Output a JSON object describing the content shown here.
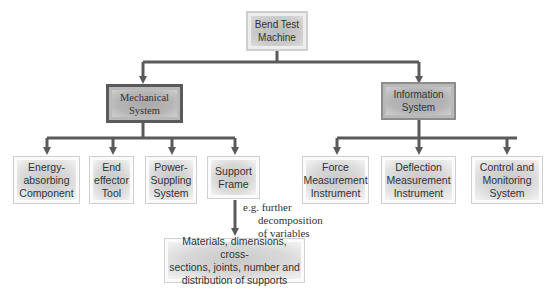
{
  "diagram": {
    "root": {
      "label_line1": "Bend Test",
      "label_line2": "Machine"
    },
    "mechanical": {
      "label_line1": "Mechanical",
      "label_line2": "System"
    },
    "information": {
      "label_line1": "Information",
      "label_line2": "System"
    },
    "mechanical_children": [
      {
        "lines": [
          "Energy-",
          "absorbing",
          "Component"
        ]
      },
      {
        "lines": [
          "End",
          "effector",
          "Tool"
        ]
      },
      {
        "lines": [
          "Power-",
          "Suppling",
          "System"
        ]
      },
      {
        "lines": [
          "Support",
          "Frame"
        ]
      }
    ],
    "information_children": [
      {
        "lines": [
          "Force",
          "Measurement",
          "Instrument"
        ]
      },
      {
        "lines": [
          "Deflection",
          "Measurement",
          "Instrument"
        ]
      },
      {
        "lines": [
          "Control and",
          "Monitoring",
          "System"
        ]
      }
    ],
    "annotation": {
      "line1": "e.g. further",
      "line2": "decomposition",
      "line3": "of variables"
    },
    "detail": {
      "line1": "Materials, dimensions, cross-",
      "line2": "sections, joints, number and",
      "line3": "distribution of supports"
    },
    "colors": {
      "line": "#5a5a5a",
      "mid_border": "#5a5a5a"
    }
  }
}
